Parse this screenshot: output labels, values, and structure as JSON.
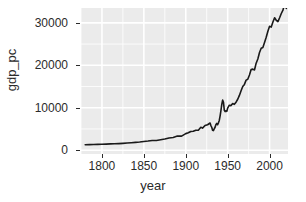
{
  "chart_data": {
    "type": "line",
    "title": "",
    "xlabel": "year",
    "ylabel": "gdp_pc",
    "xlim": [
      1775,
      2022
    ],
    "ylim": [
      -900,
      33500
    ],
    "grid": true,
    "legend": null,
    "x_ticks": [
      1800,
      1850,
      1900,
      1950,
      2000
    ],
    "x_tick_labels": [
      "1800",
      "1850",
      "1900",
      "1950",
      "2000"
    ],
    "y_ticks": [
      0,
      10000,
      20000,
      30000
    ],
    "y_tick_labels": [
      "0",
      "10000",
      "20000",
      "30000"
    ],
    "x_minor_ticks": [
      1775,
      1825,
      1875,
      1925,
      1975,
      2025
    ],
    "y_minor_ticks": [
      5000,
      15000,
      25000
    ],
    "series": [
      {
        "name": "gdp_pc",
        "color": "#1a1a1a",
        "line_width": 1.6,
        "x": [
          1780,
          1785,
          1790,
          1795,
          1800,
          1805,
          1810,
          1815,
          1820,
          1825,
          1830,
          1835,
          1840,
          1845,
          1850,
          1855,
          1860,
          1865,
          1870,
          1875,
          1880,
          1885,
          1890,
          1895,
          1900,
          1903,
          1906,
          1909,
          1912,
          1915,
          1918,
          1920,
          1923,
          1926,
          1929,
          1930,
          1931,
          1932,
          1933,
          1934,
          1935,
          1936,
          1937,
          1938,
          1939,
          1940,
          1941,
          1942,
          1943,
          1944,
          1945,
          1946,
          1947,
          1948,
          1949,
          1950,
          1952,
          1954,
          1956,
          1958,
          1960,
          1962,
          1964,
          1966,
          1968,
          1970,
          1972,
          1974,
          1976,
          1978,
          1980,
          1982,
          1984,
          1986,
          1988,
          1990,
          1992,
          1994,
          1996,
          1998,
          2000,
          2002,
          2004,
          2006,
          2008,
          2010,
          2012,
          2014,
          2016,
          2018,
          2019,
          2020
        ],
        "y": [
          1280,
          1300,
          1330,
          1360,
          1400,
          1430,
          1480,
          1500,
          1540,
          1600,
          1680,
          1760,
          1840,
          1930,
          2050,
          2150,
          2280,
          2280,
          2450,
          2620,
          2880,
          3000,
          3320,
          3300,
          3900,
          4100,
          4400,
          4450,
          4700,
          4700,
          5400,
          5200,
          5800,
          6000,
          6400,
          5800,
          5400,
          4700,
          4600,
          5050,
          5400,
          6050,
          6300,
          6000,
          6450,
          7000,
          8100,
          9400,
          10800,
          11800,
          11300,
          9400,
          9100,
          9300,
          9150,
          9900,
          10600,
          10500,
          11000,
          10800,
          11300,
          12000,
          12900,
          14000,
          15000,
          15500,
          16500,
          16700,
          17700,
          19000,
          19100,
          18900,
          20500,
          21500,
          23000,
          24000,
          24200,
          25400,
          26600,
          28000,
          29200,
          29000,
          30200,
          31200,
          30600,
          30300,
          31200,
          32200,
          33000,
          34500,
          34800,
          33400
        ]
      }
    ]
  },
  "axes": {
    "y_title": "gdp_pc",
    "x_title": "year"
  },
  "style": {
    "panel_fill": "#ebebeb",
    "gridline_major": "#ffffff",
    "gridline_minor": "#ffffff",
    "text_color": "#2b2b2b",
    "line_color": "#1a1a1a",
    "background": "#ffffff"
  }
}
